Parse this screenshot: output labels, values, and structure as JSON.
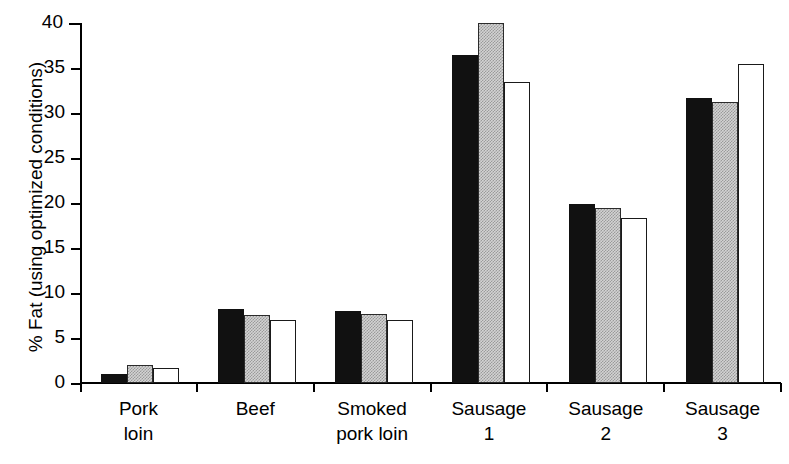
{
  "chart_data": {
    "type": "bar",
    "title": "",
    "xlabel": "",
    "ylabel": "% Fat (using optimized conditions)",
    "ylim": [
      0,
      40
    ],
    "ytick_step": 5,
    "ytick_labels": [
      "40",
      "35",
      "30",
      "25",
      "20",
      "15",
      "10",
      "5",
      "0"
    ],
    "ytick_values": [
      40,
      35,
      30,
      25,
      20,
      15,
      10,
      5,
      0
    ],
    "grid": false,
    "legend_position": "none",
    "categories": [
      "Pork\nloin",
      "Beef",
      "Smoked\npork loin",
      "Sausage\n1",
      "Sausage\n2",
      "Sausage\n3"
    ],
    "series": [
      {
        "name": "series-1",
        "fill": "black",
        "color": "#111111",
        "values": [
          1.0,
          8.2,
          8.0,
          36.5,
          19.9,
          31.7
        ]
      },
      {
        "name": "series-2",
        "fill": "stippled-gray",
        "color": "#d3d3d3",
        "values": [
          2.0,
          7.6,
          7.7,
          40.0,
          19.5,
          31.2
        ]
      },
      {
        "name": "series-3",
        "fill": "white",
        "color": "#ffffff",
        "values": [
          1.7,
          7.0,
          7.0,
          33.4,
          18.3,
          35.5
        ]
      }
    ]
  },
  "axes": {
    "y_axis_color": "#000000",
    "x_axis_color": "#000000"
  }
}
